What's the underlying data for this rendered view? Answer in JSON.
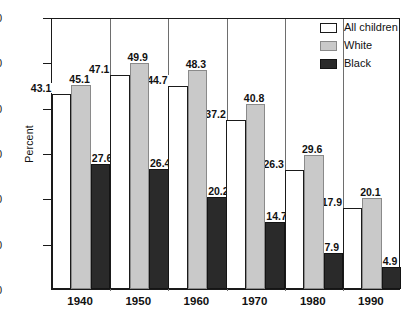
{
  "chart_data": {
    "type": "bar",
    "title": "",
    "xlabel": "",
    "ylabel": "Percent",
    "ylim": [
      0,
      60
    ],
    "yticks": [
      0,
      10,
      20,
      30,
      40,
      50,
      60
    ],
    "grid": false,
    "legend_position": "top-right",
    "categories": [
      "1940",
      "1950",
      "1960",
      "1970",
      "1980",
      "1990"
    ],
    "series": [
      {
        "name": "All children",
        "color": "#ffffff",
        "values": [
          43.1,
          47.1,
          44.7,
          37.2,
          26.3,
          17.9
        ]
      },
      {
        "name": "White",
        "color": "#c9c9c9",
        "values": [
          45.1,
          49.9,
          48.3,
          40.8,
          29.6,
          20.1
        ]
      },
      {
        "name": "Black",
        "color": "#2a2a2a",
        "values": [
          27.6,
          26.4,
          20.2,
          14.7,
          7.9,
          4.9
        ]
      }
    ]
  },
  "axis": {
    "y_title": "Percent",
    "y_ticks": [
      "0",
      "10",
      "20",
      "30",
      "40",
      "50",
      "60"
    ],
    "x_ticks": [
      "1940",
      "1950",
      "1960",
      "1970",
      "1980",
      "1990"
    ]
  },
  "legend": {
    "items": [
      {
        "label": "All children",
        "swatch": "all-children"
      },
      {
        "label": "White",
        "swatch": "white"
      },
      {
        "label": "Black",
        "swatch": "black"
      }
    ]
  },
  "labels": {
    "g0": [
      "43.1",
      "45.1",
      "27.6"
    ],
    "g1": [
      "47.1",
      "49.9",
      "26.4"
    ],
    "g2": [
      "44.7",
      "48.3",
      "20.2"
    ],
    "g3": [
      "37.2",
      "40.8",
      "14.7"
    ],
    "g4": [
      "26.3",
      "29.6",
      "7.9"
    ],
    "g5": [
      "17.9",
      "20.1",
      "4.9"
    ]
  }
}
